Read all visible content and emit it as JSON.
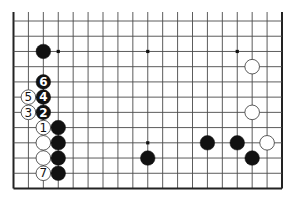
{
  "diagram": {
    "type": "go-board",
    "visible_columns": 19,
    "visible_rows": 12,
    "edges": {
      "left": true,
      "right": true,
      "bottom": true,
      "top": false
    },
    "colors": {
      "line": "#4a4a4a",
      "edge": "#222222",
      "black_stone": "#111111",
      "white_stone": "#ffffff",
      "white_outline": "#333333",
      "background": "#ffffff"
    },
    "star_points": [
      {
        "col": 3,
        "row": 2
      },
      {
        "col": 9,
        "row": 2
      },
      {
        "col": 15,
        "row": 2
      },
      {
        "col": 9,
        "row": 8
      }
    ],
    "stones": [
      {
        "color": "black",
        "col": 2,
        "row": 2,
        "label": ""
      },
      {
        "color": "black",
        "col": 2,
        "row": 4,
        "label": "6"
      },
      {
        "color": "white",
        "col": 1,
        "row": 5,
        "label": "5"
      },
      {
        "color": "black",
        "col": 2,
        "row": 5,
        "label": "4"
      },
      {
        "color": "white",
        "col": 1,
        "row": 6,
        "label": "3"
      },
      {
        "color": "black",
        "col": 2,
        "row": 6,
        "label": "2"
      },
      {
        "color": "white",
        "col": 2,
        "row": 7,
        "label": "1"
      },
      {
        "color": "black",
        "col": 3,
        "row": 7,
        "label": ""
      },
      {
        "color": "white",
        "col": 2,
        "row": 8,
        "label": ""
      },
      {
        "color": "black",
        "col": 3,
        "row": 8,
        "label": ""
      },
      {
        "color": "white",
        "col": 2,
        "row": 9,
        "label": ""
      },
      {
        "color": "black",
        "col": 3,
        "row": 9,
        "label": ""
      },
      {
        "color": "white",
        "col": 2,
        "row": 10,
        "label": "7"
      },
      {
        "color": "black",
        "col": 3,
        "row": 10,
        "label": ""
      },
      {
        "color": "black",
        "col": 9,
        "row": 9,
        "label": ""
      },
      {
        "color": "black",
        "col": 13,
        "row": 8,
        "label": ""
      },
      {
        "color": "black",
        "col": 15,
        "row": 8,
        "label": ""
      },
      {
        "color": "white",
        "col": 17,
        "row": 8,
        "label": ""
      },
      {
        "color": "black",
        "col": 16,
        "row": 9,
        "label": ""
      },
      {
        "color": "white",
        "col": 16,
        "row": 3,
        "label": ""
      },
      {
        "color": "white",
        "col": 16,
        "row": 6,
        "label": ""
      }
    ]
  }
}
